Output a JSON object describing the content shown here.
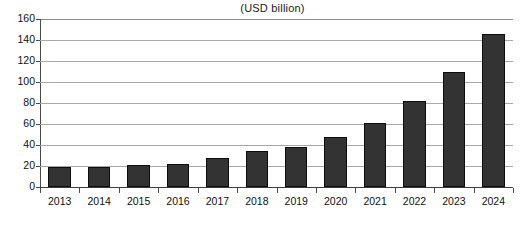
{
  "chart_data": {
    "type": "bar",
    "title": "(USD billion)",
    "xlabel": "",
    "ylabel": "",
    "categories": [
      "2013",
      "2014",
      "2015",
      "2016",
      "2017",
      "2018",
      "2019",
      "2020",
      "2021",
      "2022",
      "2023",
      "2024"
    ],
    "values": [
      19,
      19.5,
      20.5,
      21.5,
      28,
      34,
      38,
      48,
      61,
      82,
      110,
      146
    ],
    "ylim": [
      0,
      160
    ],
    "ytick_labels": [
      "160",
      "140",
      "120",
      "100",
      "80",
      "60",
      "40",
      "20",
      "0"
    ],
    "ytick_values": [
      160,
      140,
      120,
      100,
      80,
      60,
      40,
      20,
      0
    ],
    "grid": true,
    "legend": null,
    "series_color": "#333333",
    "gridline_color": "#a8a8a8",
    "axis_color": "#4a4a4a",
    "background_color": "#ffffff"
  }
}
